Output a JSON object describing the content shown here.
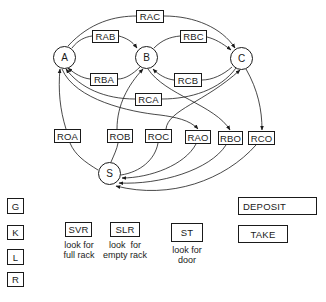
{
  "diagram": {
    "states": [
      {
        "id": "A",
        "label": "A"
      },
      {
        "id": "B",
        "label": "B"
      },
      {
        "id": "C",
        "label": "C"
      },
      {
        "id": "S",
        "label": "S"
      }
    ],
    "transitions": [
      {
        "label": "RAC",
        "from": "A",
        "to": "C"
      },
      {
        "label": "RAB",
        "from": "A",
        "to": "B"
      },
      {
        "label": "RBC",
        "from": "B",
        "to": "C"
      },
      {
        "label": "RBA",
        "from": "B",
        "to": "A"
      },
      {
        "label": "RCB",
        "from": "C",
        "to": "B"
      },
      {
        "label": "RCA",
        "from": "C",
        "to": "A"
      },
      {
        "label": "ROA",
        "from": "S",
        "to": "A"
      },
      {
        "label": "ROB",
        "from": "S",
        "to": "B"
      },
      {
        "label": "ROC",
        "from": "S",
        "to": "C"
      },
      {
        "label": "RAO",
        "from": "A",
        "to": "S"
      },
      {
        "label": "RBO",
        "from": "B",
        "to": "S"
      },
      {
        "label": "RCO",
        "from": "C",
        "to": "S"
      }
    ],
    "primitives": [
      "G",
      "K",
      "L",
      "R"
    ],
    "sensors": [
      {
        "label": "SVR",
        "caption_line1": "look for",
        "caption_line2": "full rack"
      },
      {
        "label": "SLR",
        "caption_line1": "look  for",
        "caption_line2": "empty rack"
      },
      {
        "label": "ST",
        "caption_line1": "look for",
        "caption_line2": "door"
      }
    ],
    "actions": [
      "DEPOSIT",
      "TAKE"
    ]
  }
}
